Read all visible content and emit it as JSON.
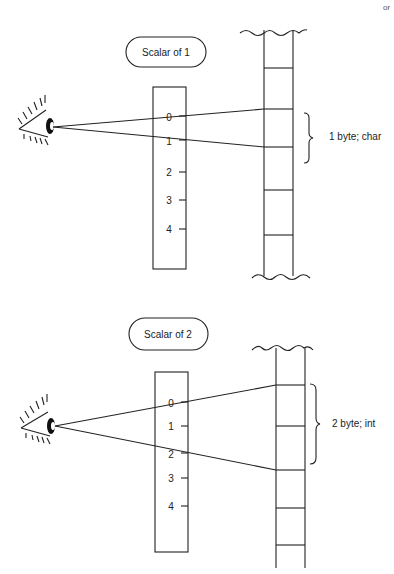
{
  "corner_text": "or",
  "panels": [
    {
      "scalar_label": "Scalar of 1",
      "ruler_ticks": [
        "0",
        "1",
        "2",
        "3",
        "4"
      ],
      "brace_label": "1 byte; char"
    },
    {
      "scalar_label": "Scalar of 2",
      "ruler_ticks": [
        "0",
        "1",
        "2",
        "3",
        "4"
      ],
      "brace_label": "2 byte; int"
    }
  ],
  "icons": {
    "eye": "eye-icon"
  }
}
